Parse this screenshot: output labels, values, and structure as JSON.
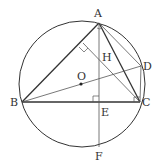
{
  "diagram": {
    "type": "geometry",
    "colors": {
      "stroke_heavy": "#333333",
      "stroke_light": "#555555",
      "background": "#ffffff"
    },
    "circle": {
      "center": "O",
      "cx": 82,
      "cy": 84,
      "r": 63
    },
    "points": {
      "A": {
        "label": "A",
        "x": 99,
        "y": 23
      },
      "B": {
        "label": "B",
        "x": 22,
        "y": 102
      },
      "C": {
        "label": "C",
        "x": 140,
        "y": 102
      },
      "D": {
        "label": "D",
        "x": 141,
        "y": 66
      },
      "E": {
        "label": "E",
        "x": 99,
        "y": 102
      },
      "F": {
        "label": "F",
        "x": 99,
        "y": 147
      },
      "H": {
        "label": "H",
        "x": 99,
        "y": 57
      },
      "O": {
        "label": "O",
        "x": 81,
        "y": 84
      }
    },
    "segments": [
      "AB",
      "AC",
      "BC",
      "AF",
      "BD",
      "AD",
      "CD",
      "C-to-AB-foot"
    ],
    "right_angles": [
      "at E (AE ⊥ BC)",
      "on AB (CH ⊥ AB)",
      "at C (BCD)"
    ]
  }
}
